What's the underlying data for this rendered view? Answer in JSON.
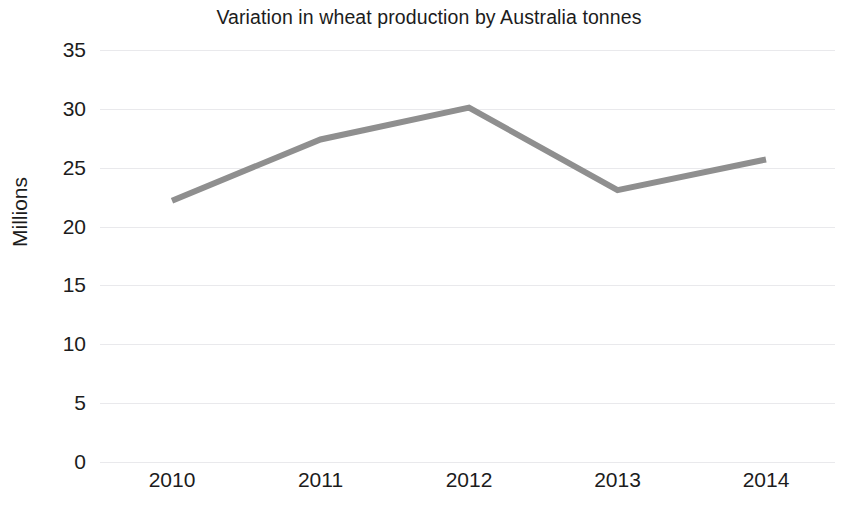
{
  "chart_data": {
    "type": "line",
    "title": "Variation in wheat production by Australia tonnes",
    "xlabel": "",
    "ylabel": "Millions",
    "categories": [
      "2010",
      "2011",
      "2012",
      "2013",
      "2014"
    ],
    "x": [
      2010,
      2011,
      2012,
      2013,
      2014
    ],
    "series": [
      {
        "name": "Wheat production",
        "values": [
          22.2,
          27.4,
          30.1,
          23.1,
          25.7
        ],
        "color": "#8f8f8f"
      }
    ],
    "values": [
      22.2,
      27.4,
      30.1,
      23.1,
      25.7
    ],
    "ylim": [
      0,
      35
    ],
    "y_ticks": [
      0,
      5,
      10,
      15,
      20,
      25,
      30,
      35
    ],
    "y_tick_labels": [
      "0",
      "5",
      "10",
      "15",
      "20",
      "25",
      "30",
      "35"
    ],
    "grid": true,
    "grid_axis": "y",
    "grid_color": "#e9e9ec",
    "legend": false,
    "legend_position": "none",
    "markers": false,
    "line_width": 6,
    "background": "#ffffff",
    "text_color": "#1c1c1c",
    "annotations": []
  },
  "axes": {
    "y_title": "Millions",
    "y_ticks": [
      {
        "label": "35",
        "value": 35
      },
      {
        "label": "30",
        "value": 30
      },
      {
        "label": "25",
        "value": 25
      },
      {
        "label": "20",
        "value": 20
      },
      {
        "label": "15",
        "value": 15
      },
      {
        "label": "10",
        "value": 10
      },
      {
        "label": "5",
        "value": 5
      },
      {
        "label": "0",
        "value": 0
      }
    ],
    "x_ticks": [
      {
        "label": "2010"
      },
      {
        "label": "2011"
      },
      {
        "label": "2012"
      },
      {
        "label": "2013"
      },
      {
        "label": "2014"
      }
    ]
  },
  "header": {
    "title": "Variation in wheat production by Australia tonnes"
  }
}
